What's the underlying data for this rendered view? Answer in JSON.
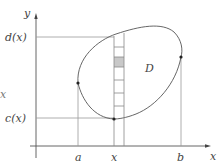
{
  "diagram": {
    "axes": {
      "x_label": "x",
      "y_label": "y"
    },
    "labels": {
      "upper": "d(x)",
      "lower": "c(x)",
      "region": "D",
      "a": "a",
      "x": "x",
      "b": "b",
      "stray": "x"
    },
    "strip": {
      "cells": 8,
      "highlighted_cell": 2
    },
    "colors": {
      "line": "#555555",
      "guide": "#999999",
      "highlight": "#c8c8c8"
    }
  }
}
